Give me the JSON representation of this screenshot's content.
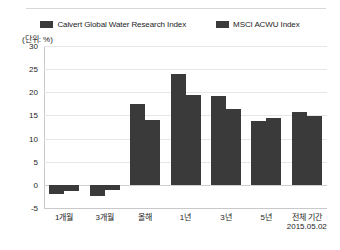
{
  "chart_data": {
    "type": "bar",
    "title": "",
    "subtitle": "",
    "xlabel": "",
    "ylabel": "",
    "unit_label": "(단위: %)",
    "ylim": [
      -5,
      30
    ],
    "yticks": [
      30,
      25,
      20,
      15,
      10,
      5,
      0,
      -5
    ],
    "grid": true,
    "legend_position": "top-center",
    "bar_color": "#3a3a3a",
    "gridline_color": "#e6e6e8",
    "axis_color": "#c9c9cb",
    "categories": [
      "1개월",
      "3개월",
      "올해",
      "1년",
      "3년",
      "5년",
      "전체 기간"
    ],
    "footnote": "2015.05.02",
    "series": [
      {
        "name": "Calvert Global Water Research Index",
        "color": "#3a3a3a",
        "values": [
          -2.0,
          -2.5,
          17.5,
          24.0,
          19.3,
          13.9,
          15.8
        ]
      },
      {
        "name": "MSCI ACWU Index",
        "color": "#3a3a3a",
        "values": [
          -1.3,
          -1.2,
          14.0,
          19.5,
          16.3,
          14.5,
          14.8
        ]
      }
    ]
  },
  "legend": {
    "items": [
      {
        "label": "Calvert Global Water Research Index",
        "swatch": "legend-swatch-calvert"
      },
      {
        "label": "MSCI ACWU Index",
        "swatch": "legend-swatch-msci"
      }
    ]
  },
  "axis": {
    "unit": "(단위: %)",
    "y": [
      "30",
      "25",
      "20",
      "15",
      "10",
      "5",
      "0",
      "-5"
    ],
    "x": [
      "1개월",
      "3개월",
      "올해",
      "1년",
      "3년",
      "5년",
      "전체 기간"
    ],
    "date": "2015.05.02"
  }
}
